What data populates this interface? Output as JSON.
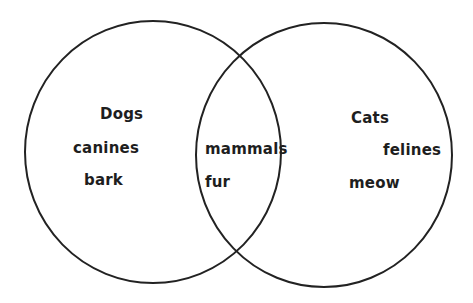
{
  "diagram": {
    "type": "venn",
    "stroke_color": "#222222",
    "background": "#ffffff",
    "sets": [
      {
        "name": "left-set",
        "title": "Dogs",
        "items": [
          "canines",
          "bark"
        ]
      },
      {
        "name": "right-set",
        "title": "Cats",
        "items": [
          "felines",
          "meow"
        ]
      }
    ],
    "intersection": {
      "items": [
        "mammals",
        "fur"
      ]
    }
  }
}
